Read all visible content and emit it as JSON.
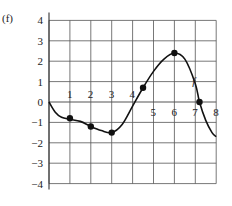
{
  "panel_label": "(f)",
  "curve_label": "f",
  "chart_data": {
    "type": "line",
    "title": "",
    "xlabel": "",
    "ylabel": "",
    "xlim": [
      0,
      8
    ],
    "ylim": [
      -4,
      4
    ],
    "grid": true,
    "x_ticks": [
      "1",
      "2",
      "3",
      "4",
      "5",
      "6",
      "7",
      "8"
    ],
    "y_ticks": [
      "4",
      "3",
      "2",
      "1",
      "0",
      "-1",
      "-2",
      "-3",
      "-4"
    ],
    "series": [
      {
        "name": "f",
        "curve": [
          [
            0,
            0
          ],
          [
            0.3,
            -0.5
          ],
          [
            0.6,
            -0.75
          ],
          [
            1,
            -0.85
          ],
          [
            1.5,
            -0.95
          ],
          [
            2,
            -1.2
          ],
          [
            2.5,
            -1.4
          ],
          [
            3,
            -1.5
          ],
          [
            3.5,
            -1.1
          ],
          [
            4,
            -0.2
          ],
          [
            4.5,
            0.7
          ],
          [
            5,
            1.5
          ],
          [
            5.5,
            2.1
          ],
          [
            6,
            2.4
          ],
          [
            6.5,
            2.1
          ],
          [
            7,
            0.9
          ],
          [
            7.2,
            0
          ],
          [
            7.5,
            -0.9
          ],
          [
            7.8,
            -1.5
          ],
          [
            8,
            -1.7
          ]
        ],
        "marked_points": [
          [
            1,
            -0.8
          ],
          [
            2,
            -1.2
          ],
          [
            3,
            -1.5
          ],
          [
            4.5,
            0.7
          ],
          [
            6,
            2.4
          ],
          [
            7.2,
            0
          ]
        ]
      }
    ]
  }
}
